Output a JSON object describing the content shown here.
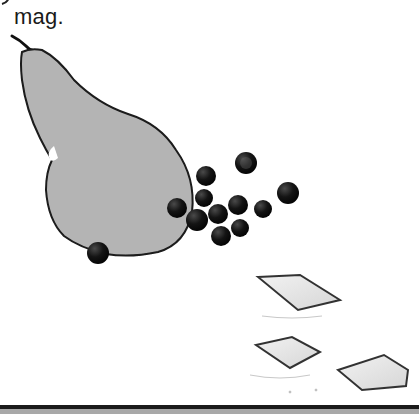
{
  "caption": {
    "text": "mag."
  },
  "illustration": {
    "subject": "pear-with-berries-and-crackers",
    "colors": {
      "pear_fill": "#b4b4b4",
      "outline": "#1a1a1a",
      "berry": "#141414",
      "cracker_fill": "#e4e4e4"
    }
  }
}
